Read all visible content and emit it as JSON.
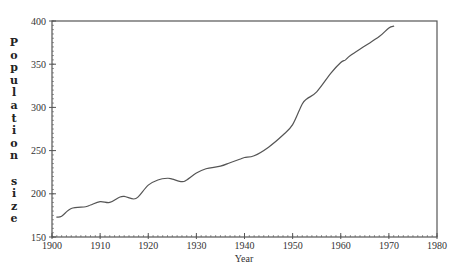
{
  "chart_data": {
    "type": "line",
    "title": "",
    "xlabel": "Year",
    "ylabel": "Population size",
    "xlim": [
      1900,
      1980
    ],
    "ylim": [
      150,
      400
    ],
    "x_ticks": [
      1900,
      1910,
      1920,
      1930,
      1940,
      1950,
      1960,
      1970,
      1980
    ],
    "y_ticks": [
      150,
      200,
      250,
      300,
      350,
      400
    ],
    "grid": false,
    "legend": null,
    "series": [
      {
        "name": "Population size",
        "color": "#555555",
        "x": [
          1901,
          1902,
          1904,
          1907,
          1908,
          1910,
          1912,
          1914,
          1915,
          1917,
          1918,
          1920,
          1922,
          1924,
          1925,
          1927,
          1928,
          1930,
          1932,
          1935,
          1937,
          1939,
          1940,
          1942,
          1945,
          1948,
          1950,
          1952,
          1953,
          1955,
          1958,
          1960,
          1961,
          1962,
          1965,
          1968,
          1970,
          1971
        ],
        "values": [
          173,
          174,
          183,
          185,
          187,
          191,
          190,
          196,
          197,
          194,
          197,
          210,
          216,
          218,
          217,
          214,
          216,
          224,
          229,
          232,
          236,
          240,
          242,
          244,
          254,
          268,
          280,
          304,
          310,
          318,
          340,
          352,
          355,
          360,
          371,
          382,
          392,
          394
        ]
      }
    ]
  },
  "labels": {
    "ylabel_letters": [
      "P",
      "o",
      "p",
      "u",
      "l",
      "a",
      "t",
      "i",
      "o",
      "n",
      "",
      "s",
      "i",
      "z",
      "e"
    ],
    "xlabel": "Year",
    "x_tick_labels": [
      "1900",
      "1910",
      "1920",
      "1930",
      "1940",
      "1950",
      "1960",
      "1970",
      "1980"
    ],
    "y_tick_labels": [
      "150",
      "200",
      "250",
      "300",
      "350",
      "400"
    ]
  },
  "colors": {
    "axis": "#555555",
    "line": "#555555",
    "text": "#333333"
  }
}
